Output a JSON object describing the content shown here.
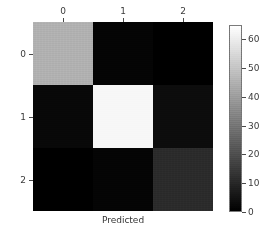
{
  "chart_data": {
    "type": "heatmap",
    "title": "",
    "xlabel": "Predicted",
    "ylabel": "True",
    "x_tick_labels": [
      "0",
      "1",
      "2"
    ],
    "y_tick_labels": [
      "0",
      "1",
      "2"
    ],
    "xticks_position": "top",
    "grid": false,
    "colormap": "gray",
    "values": [
      [
        45,
        1,
        0
      ],
      [
        2,
        63,
        3
      ],
      [
        0,
        1,
        11
      ]
    ],
    "vmin": 0,
    "vmax": 65,
    "colorbar": {
      "ticks": [
        0,
        10,
        20,
        30,
        40,
        50,
        60
      ],
      "tick_labels": [
        "0",
        "10",
        "20",
        "30",
        "40",
        "50",
        "60"
      ],
      "min_color": "#000000",
      "max_color": "#ffffff",
      "position": "right"
    }
  }
}
